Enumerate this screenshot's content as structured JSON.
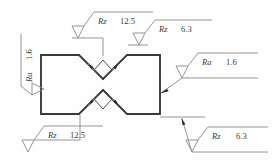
{
  "drawing": {
    "title": "Surface roughness symbols on notched part",
    "background_color": "#fefefe",
    "outline_color": "#3a3a3a",
    "leader_color": "#8a8a8a",
    "text_color": "#3b3b3b"
  },
  "annotations": {
    "top_left": {
      "parameter": "Rz",
      "value": "12.5",
      "symbol": "surface-finish-triangle"
    },
    "top_right": {
      "parameter": "Rz",
      "value": "6.3",
      "symbol": "surface-finish-triangle"
    },
    "left": {
      "parameter": "Ra",
      "value": "1.6",
      "symbol": "surface-finish-triangle"
    },
    "right": {
      "parameter": "Ra",
      "value": "1.6",
      "symbol": "surface-finish-triangle"
    },
    "bottom_left": {
      "parameter": "Rz",
      "value": "12.5",
      "symbol": "surface-finish-triangle"
    },
    "bottom_right": {
      "parameter": "Rz",
      "value": "6.3",
      "symbol": "surface-finish-triangle"
    }
  },
  "part": {
    "name": "notched-block",
    "feature_top": "v-notch",
    "feature_bottom": "v-notch"
  }
}
